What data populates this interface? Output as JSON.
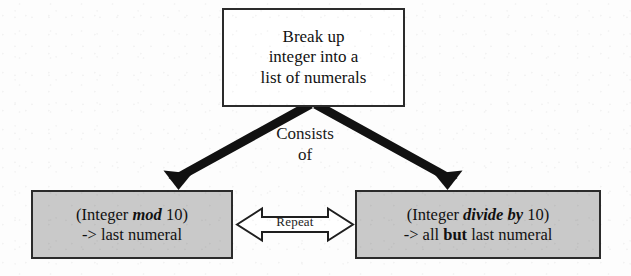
{
  "diagram": {
    "type": "flowchart",
    "title_box": {
      "name": "break-up-integer-box",
      "fill": "#ffffff",
      "lines": [
        "Break up",
        "integer into a",
        "list of numerals"
      ]
    },
    "edge_label": {
      "name": "consists-of",
      "lines": [
        "Consists",
        "of"
      ]
    },
    "left_box": {
      "name": "integer-mod-10-box",
      "fill": "#c9c9c9",
      "line1": {
        "prefix": "(Integer ",
        "emphasis": "mod",
        "suffix": " 10)"
      },
      "line2": "-> last numeral"
    },
    "right_box": {
      "name": "integer-divide-by-10-box",
      "fill": "#c9c9c9",
      "line1": {
        "prefix": "(Integer ",
        "emphasis": "divide by",
        "suffix": " 10)"
      },
      "line2": {
        "prefix": "-> all ",
        "emphasis": "but",
        "suffix": " last numeral"
      }
    },
    "repeat_arrow": {
      "name": "repeat-double-arrow",
      "label": "Repeat",
      "fill": "#ffffff",
      "stroke": "#1f1f1f"
    },
    "connectors": [
      {
        "name": "arrow-to-left-box",
        "from": "break-up-integer-box",
        "to": "integer-mod-10-box",
        "label": "Consists of",
        "stroke": "#111111"
      },
      {
        "name": "arrow-to-right-box",
        "from": "break-up-integer-box",
        "to": "integer-divide-by-10-box",
        "label": "Consists of",
        "stroke": "#111111"
      }
    ]
  }
}
